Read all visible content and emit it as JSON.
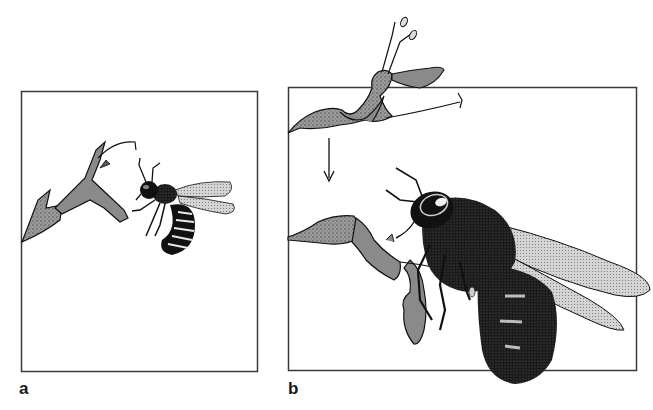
{
  "figure": {
    "panels": [
      {
        "id": "a",
        "label": "a",
        "description": "bee approaching flower"
      },
      {
        "id": "b",
        "label": "b",
        "description": "bee visiting flower; flower shown before and after contact with arrow"
      }
    ]
  },
  "colors": {
    "frame": "#3a3a3a",
    "ink": "#111111",
    "flower_fill": "#8a8a8a",
    "flower_light": "#b5b5b5",
    "wing_fill": "#c8c8c8",
    "background": "#ffffff"
  }
}
